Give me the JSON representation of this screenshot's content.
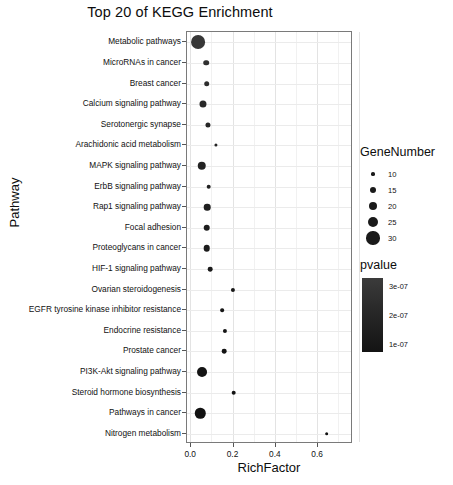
{
  "chart_data": {
    "type": "scatter",
    "title": "Top 20 of KEGG Enrichment",
    "xlabel": "RichFactor",
    "ylabel": "Pathway",
    "xlim": [
      -0.02,
      0.765
    ],
    "xticks": [
      0.0,
      0.2,
      0.4,
      0.6
    ],
    "xticklabels": [
      "0.0",
      "0.2",
      "0.4",
      "0.6"
    ],
    "grid": true,
    "legend_position": "right",
    "categories": [
      "Metabolic pathways",
      "MicroRNAs in cancer",
      "Breast cancer",
      "Calcium signaling pathway",
      "Serotonergic synapse",
      "Arachidonic acid metabolism",
      "MAPK signaling pathway",
      "ErbB signaling pathway",
      "Rap1 signaling pathway",
      "Focal adhesion",
      "Proteoglycans in cancer",
      "HIF-1 signaling pathway",
      "Ovarian steroidogenesis",
      "EGFR tyrosine kinase inhibitor resistance",
      "Endocrine resistance",
      "Prostate cancer",
      "PI3K-Akt signaling pathway",
      "Steroid hormone biosynthesis",
      "Pathways in cancer",
      "Nitrogen metabolism"
    ],
    "points": [
      {
        "pathway": "Metabolic pathways",
        "richfactor": 0.031,
        "genenumber": 31,
        "pvalue": 3e-07
      },
      {
        "pathway": "MicroRNAs in cancer",
        "richfactor": 0.072,
        "genenumber": 14,
        "pvalue": 2.6e-07
      },
      {
        "pathway": "Breast cancer",
        "richfactor": 0.073,
        "genenumber": 14,
        "pvalue": 2.4e-07
      },
      {
        "pathway": "Calcium signaling pathway",
        "richfactor": 0.056,
        "genenumber": 17,
        "pvalue": 2.2e-07
      },
      {
        "pathway": "Serotonergic synapse",
        "richfactor": 0.078,
        "genenumber": 13,
        "pvalue": 2e-07
      },
      {
        "pathway": "Arachidonic acid metabolism",
        "richfactor": 0.117,
        "genenumber": 9,
        "pvalue": 1.9e-07
      },
      {
        "pathway": "MAPK signaling pathway",
        "richfactor": 0.05,
        "genenumber": 20,
        "pvalue": 1.8e-07
      },
      {
        "pathway": "ErbB signaling pathway",
        "richfactor": 0.082,
        "genenumber": 12,
        "pvalue": 1.7e-07
      },
      {
        "pathway": "Rap1 signaling pathway",
        "richfactor": 0.076,
        "genenumber": 16,
        "pvalue": 1.6e-07
      },
      {
        "pathway": "Focal adhesion",
        "richfactor": 0.074,
        "genenumber": 16,
        "pvalue": 1.5e-07
      },
      {
        "pathway": "Proteoglycans in cancer",
        "richfactor": 0.074,
        "genenumber": 16,
        "pvalue": 1.4e-07
      },
      {
        "pathway": "HIF-1 signaling pathway",
        "richfactor": 0.09,
        "genenumber": 12,
        "pvalue": 1.3e-07
      },
      {
        "pathway": "Ovarian steroidogenesis",
        "richfactor": 0.199,
        "genenumber": 11,
        "pvalue": 1.2e-07
      },
      {
        "pathway": "EGFR tyrosine kinase inhibitor resistance",
        "richfactor": 0.146,
        "genenumber": 10,
        "pvalue": 1.1e-07
      },
      {
        "pathway": "Endocrine resistance",
        "richfactor": 0.161,
        "genenumber": 11,
        "pvalue": 1e-07
      },
      {
        "pathway": "Prostate cancer",
        "richfactor": 0.157,
        "genenumber": 12,
        "pvalue": 9.5e-08
      },
      {
        "pathway": "PI3K-Akt signaling pathway",
        "richfactor": 0.05,
        "genenumber": 23,
        "pvalue": 9e-08
      },
      {
        "pathway": "Steroid hormone biosynthesis",
        "richfactor": 0.2,
        "genenumber": 12,
        "pvalue": 8.5e-08
      },
      {
        "pathway": "Pathways in cancer",
        "richfactor": 0.043,
        "genenumber": 24,
        "pvalue": 8e-08
      },
      {
        "pathway": "Nitrogen metabolism",
        "richfactor": 0.64,
        "genenumber": 10,
        "pvalue": 7.5e-08
      }
    ],
    "size_legend": {
      "title": "GeneNumber",
      "values": [
        10,
        15,
        20,
        25,
        30
      ],
      "labels": [
        "10",
        "15",
        "20",
        "25",
        "30"
      ]
    },
    "color_legend": {
      "title": "pvalue",
      "ticks": [
        3e-07,
        2e-07,
        1e-07
      ],
      "labels": [
        "3e-07",
        "2e-07",
        "1e-07"
      ],
      "gradient_high": "#3b3b3b",
      "gradient_low": "#141414"
    },
    "dot_color": "#1a1a1a",
    "grid_color": "#ebebeb",
    "panel_border_color": "#7a7a7a"
  }
}
